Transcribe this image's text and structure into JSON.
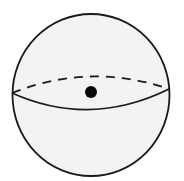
{
  "diagram": {
    "type": "sphere",
    "colors": {
      "background": "#ffffff",
      "fill": "#f3f3f3",
      "stroke": "#1a1a1a",
      "center_dot": "#0a0a0a"
    },
    "sphere": {
      "cx": 91,
      "cy": 95,
      "rx": 78.5,
      "ry": 81
    },
    "equator": {
      "left": [
        12,
        93
      ],
      "right": [
        169,
        89
      ],
      "back_control_y": 62,
      "front_control_y": 128,
      "back_style": "dashed",
      "front_style": "solid"
    },
    "center_point": {
      "cx": 91,
      "cy": 92,
      "r": 6
    }
  }
}
